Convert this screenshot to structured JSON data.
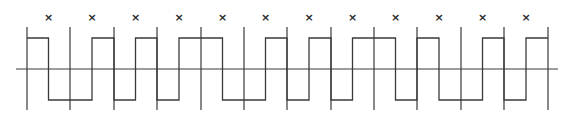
{
  "diagram": {
    "type": "manchester-encoding-waveform",
    "bit_cell_count": 12,
    "mid_bit_marker": "×",
    "levels": [
      {
        "first": "H",
        "second": "L"
      },
      {
        "first": "L",
        "second": "H"
      },
      {
        "first": "L",
        "second": "H"
      },
      {
        "first": "L",
        "second": "H"
      },
      {
        "first": "H",
        "second": "L"
      },
      {
        "first": "L",
        "second": "H"
      },
      {
        "first": "L",
        "second": "H"
      },
      {
        "first": "L",
        "second": "H"
      },
      {
        "first": "H",
        "second": "L"
      },
      {
        "first": "H",
        "second": "L"
      },
      {
        "first": "L",
        "second": "H"
      },
      {
        "first": "L",
        "second": "H"
      }
    ],
    "boundaries_x": [
      27,
      70,
      114,
      157,
      201,
      244,
      287,
      331,
      374,
      417,
      461,
      504,
      548
    ],
    "geometry": {
      "axis_y": 69,
      "axis_x_start": 16,
      "axis_x_end": 558,
      "high_y": 38,
      "low_y": 100,
      "boundary_top": 27,
      "boundary_bottom": 110,
      "marker_y": 21
    },
    "colors": {
      "line": "#3a3a3a",
      "marker": "#2a2a2a",
      "background": "#ffffff"
    }
  }
}
